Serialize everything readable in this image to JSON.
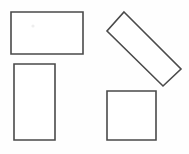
{
  "figure": {
    "width": 189,
    "height": 154,
    "background_color": "#fefefe",
    "stroke_color": "#4a4a4a",
    "fill_color": "#ffffff",
    "stroke_width": 1.6,
    "shape_count": "4"
  },
  "shapes": [
    {
      "id": "wide-rectangle-top-left",
      "label": "Wide rectangle",
      "type": "rectangle",
      "x": 11,
      "y": 12,
      "width": 72,
      "height": 42,
      "rotation": 0,
      "points": "11,12 83,12 83,54 11,54"
    },
    {
      "id": "tall-rectangle-bottom-left",
      "label": "Tall rectangle",
      "type": "rectangle",
      "x": 14,
      "y": 64,
      "width": 41,
      "height": 76,
      "rotation": 0,
      "points": "14,64 55,64 55,140 14,140"
    },
    {
      "id": "rotated-bar-top-right",
      "label": "Rotated elongated rectangle",
      "type": "rectangle",
      "rotation": 45,
      "points": "124,12 181,69 163,86 107,31"
    },
    {
      "id": "square-bottom-right",
      "label": "Square",
      "type": "square",
      "x": 107,
      "y": 91,
      "width": 49,
      "height": 49,
      "rotation": 0,
      "points": "107,91 156,91 156,140 107,140"
    }
  ],
  "artifacts": [
    {
      "id": "faint-speck",
      "label": "Faint speck inside wide rectangle",
      "cx": 33,
      "cy": 26,
      "r": 1.6
    }
  ]
}
